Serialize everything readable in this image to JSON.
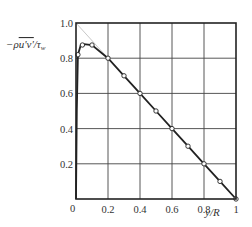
{
  "chart_data": {
    "type": "line",
    "title": "",
    "xlabel": "y/R",
    "ylabel": "-ρu'v'/τw",
    "xlim": [
      0,
      1.0
    ],
    "ylim": [
      0,
      1.0
    ],
    "grid": true,
    "x_ticks": [
      "0",
      "0.2",
      "0.4",
      "0.6",
      "0.8",
      "1"
    ],
    "y_ticks": [
      "0.2",
      "0.4",
      "0.6",
      "0.8",
      "1.0"
    ],
    "origin_label": "0",
    "reference_line": {
      "name": "1 - y/R",
      "x": [
        0,
        1.0
      ],
      "y": [
        1.0,
        0
      ],
      "color": "#c8c8c8"
    },
    "series": [
      {
        "name": "curve",
        "x": [
          0,
          0.005,
          0.012,
          0.03,
          0.05,
          0.1,
          0.2,
          0.3,
          0.4,
          0.5,
          0.6,
          0.7,
          0.8,
          0.9,
          1.0
        ],
        "y": [
          0,
          0.5,
          0.82,
          0.875,
          0.88,
          0.875,
          0.8,
          0.7,
          0.6,
          0.5,
          0.4,
          0.3,
          0.2,
          0.1,
          0
        ],
        "color": "#222222"
      },
      {
        "name": "data points",
        "marker": "open-circle",
        "x": [
          0.012,
          0.04,
          0.1,
          0.2,
          0.3,
          0.4,
          0.5,
          0.6,
          0.7,
          0.8,
          0.9,
          1.0
        ],
        "y": [
          0.82,
          0.875,
          0.875,
          0.8,
          0.7,
          0.6,
          0.5,
          0.4,
          0.3,
          0.2,
          0.1,
          0
        ]
      }
    ]
  },
  "labels": {
    "y_axis_main": "−ρ",
    "y_axis_overline": "u'v'",
    "y_axis_tail": "/τ",
    "y_axis_sub": "w",
    "x_axis": "y/R"
  }
}
